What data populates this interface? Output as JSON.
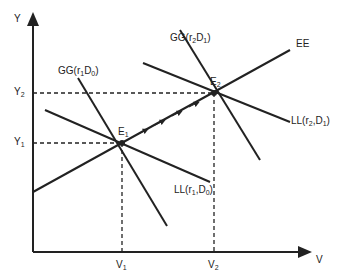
{
  "axes": {
    "y_label": "Y",
    "x_label": "V",
    "y_ticks": [
      {
        "label": "Y",
        "sub": "2"
      },
      {
        "label": "Y",
        "sub": "1"
      }
    ],
    "x_ticks": [
      {
        "label": "V",
        "sub": "1"
      },
      {
        "label": "V",
        "sub": "2"
      }
    ]
  },
  "curves": {
    "ee": "EE",
    "gg1": {
      "text": "GG(r",
      "s1": "1",
      "mid": "D",
      "s2": "0",
      "end": ")"
    },
    "gg2": {
      "text": "GG(r",
      "s1": "2",
      "mid": "D",
      "s2": "1",
      "end": ")"
    },
    "ll1": {
      "text": "LL(r",
      "s1": "1",
      "mid": ",D",
      "s2": "0",
      "end": ")"
    },
    "ll2": {
      "text": "LL(r",
      "s1": "2",
      "mid": ",D",
      "s2": "1",
      "end": ")"
    }
  },
  "points": {
    "e1": {
      "label": "E",
      "sub": "1"
    },
    "e2": {
      "label": "E",
      "sub": "2"
    }
  },
  "colors": {
    "line": "#222222",
    "background": "#ffffff"
  }
}
